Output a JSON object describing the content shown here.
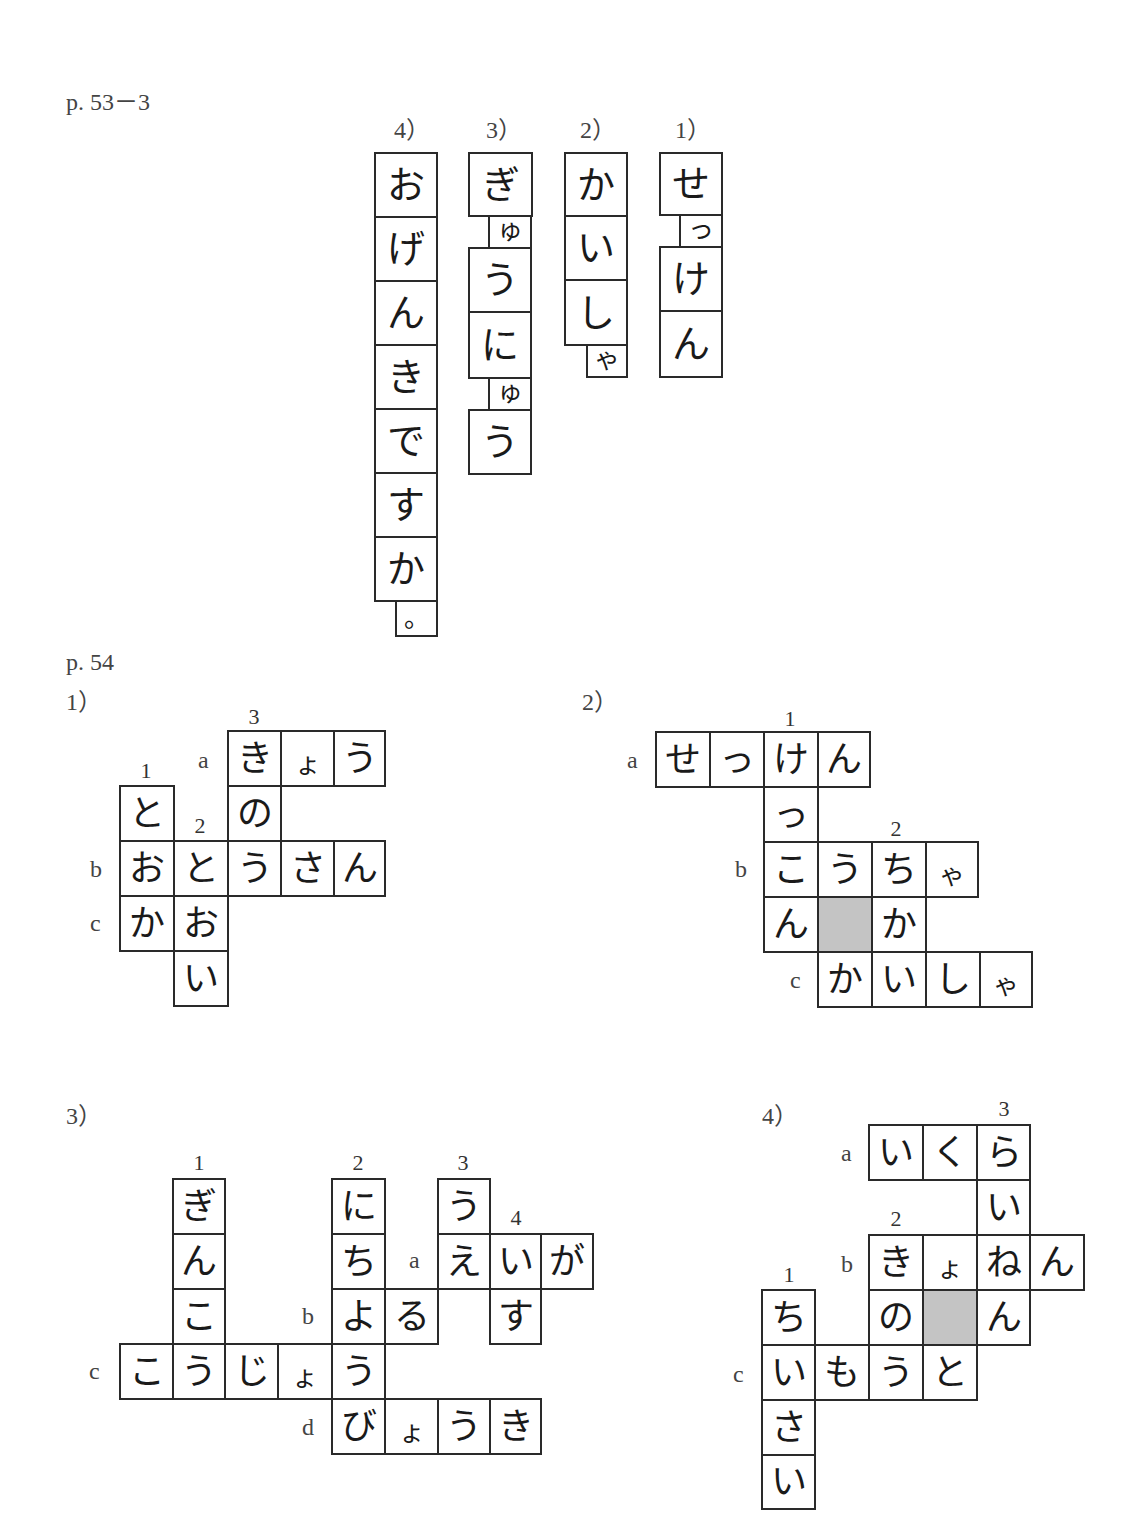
{
  "section_53": {
    "label": "p. 53－3",
    "items": [
      {
        "label": "1）",
        "chars": [
          "せ",
          "っ",
          "け",
          "ん"
        ]
      },
      {
        "label": "2）",
        "chars": [
          "か",
          "い",
          "し",
          "ゃ"
        ]
      },
      {
        "label": "3）",
        "chars": [
          "ぎ",
          "ゅ",
          "う",
          "に",
          "ゅ",
          "う"
        ]
      },
      {
        "label": "4）",
        "chars": [
          "お",
          "げ",
          "ん",
          "き",
          "で",
          "す",
          "か",
          "。"
        ]
      }
    ]
  },
  "section_54": {
    "label": "p. 54",
    "puzzles": [
      {
        "label": "1）",
        "down_numbers": [
          "1",
          "2",
          "3"
        ],
        "across_letters": [
          "a",
          "b",
          "c"
        ],
        "cells": [
          "き",
          "ょ",
          "う",
          "の",
          "と",
          "お",
          "と",
          "う",
          "さ",
          "ん",
          "か",
          "お",
          "い"
        ],
        "answers": {
          "across": {
            "a": "きょう",
            "b": "おとうさん",
            "c": "かお"
          },
          "down": {
            "1": "とおか",
            "2": "とおい",
            "3": "きのう"
          }
        }
      },
      {
        "label": "2）",
        "down_numbers": [
          "1",
          "2"
        ],
        "across_letters": [
          "a",
          "b",
          "c"
        ],
        "cells": [
          "せ",
          "っ",
          "け",
          "ん",
          "っ",
          "こ",
          "う",
          "ち",
          "ゃ",
          "ん",
          "か",
          "か",
          "い",
          "し",
          "ゃ"
        ],
        "answers": {
          "across": {
            "a": "せっけん",
            "b": "こうちゃ",
            "c": "かいしゃ"
          },
          "down": {
            "1": "けっこん",
            "2": "ちか"
          }
        }
      },
      {
        "label": "3）",
        "down_numbers": [
          "1",
          "2",
          "3",
          "4"
        ],
        "across_letters": [
          "a",
          "b",
          "c",
          "d"
        ],
        "cells": [
          "ぎ",
          "ん",
          "こ",
          "に",
          "ち",
          "よ",
          "う",
          "う",
          "え",
          "い",
          "が",
          "る",
          "す",
          "こ",
          "う",
          "じ",
          "ょ",
          "び",
          "ょ",
          "う",
          "き"
        ],
        "answers": {
          "across": {
            "a": "えいが",
            "b": "よる",
            "c": "こうじょう",
            "d": "びょうき"
          },
          "down": {
            "1": "ぎんこう",
            "2": "にちようび",
            "3": "うえ",
            "4": "いす"
          }
        }
      },
      {
        "label": "4）",
        "down_numbers": [
          "1",
          "2",
          "3"
        ],
        "across_letters": [
          "a",
          "b",
          "c"
        ],
        "cells": [
          "い",
          "く",
          "ら",
          "い",
          "き",
          "ょ",
          "ね",
          "ん",
          "の",
          "ん",
          "ち",
          "い",
          "も",
          "う",
          "と",
          "さ",
          "い"
        ],
        "answers": {
          "across": {
            "a": "いくら",
            "b": "きょねん",
            "c": "いもうと"
          },
          "down": {
            "1": "ちいさい",
            "2": "きのう",
            "3": "らいねん"
          }
        }
      }
    ]
  },
  "colors": {
    "line": "#2a2a2a",
    "shaded_cell": "#c4c4c4",
    "label_text": "#444444"
  }
}
